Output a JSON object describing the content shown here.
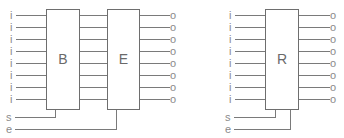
{
  "diagram": {
    "title": "",
    "rows": 8,
    "left_group": {
      "blocks": [
        {
          "id": "B",
          "label": "B"
        },
        {
          "id": "E",
          "label": "E"
        }
      ],
      "input_label": "i",
      "output_label": "o",
      "control_inputs": [
        {
          "label": "s",
          "connects_to": "B"
        },
        {
          "label": "e",
          "connects_to": "E"
        }
      ]
    },
    "right_group": {
      "blocks": [
        {
          "id": "R",
          "label": "R"
        }
      ],
      "input_label": "i",
      "output_label": "o",
      "control_inputs": [
        {
          "label": "s",
          "connects_to": "R"
        },
        {
          "label": "e",
          "connects_to": "R"
        }
      ]
    },
    "colors": {
      "line": "#7a7a7a",
      "text": "#8a8a8a"
    }
  }
}
